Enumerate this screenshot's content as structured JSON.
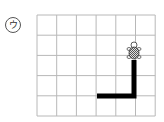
{
  "problem_label": "ウ",
  "grid": {
    "columns": 6,
    "rows": 5,
    "origin_x": 37,
    "origin_y": 15,
    "cell_w": 19.7,
    "cell_h": 20.2,
    "line_color": "#b8b8b8"
  },
  "path": {
    "color": "#000000",
    "width": 5,
    "points": [
      [
        97,
        96
      ],
      [
        134,
        96
      ],
      [
        134,
        60
      ]
    ]
  },
  "turtle": {
    "x": 134,
    "y": 52,
    "icon": "turtle-icon"
  }
}
